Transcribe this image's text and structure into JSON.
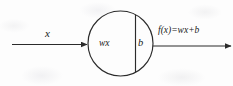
{
  "diagram": {
    "type": "neuron-schematic",
    "stroke_color": "#2b2b2b",
    "background_color": "#fdfdfd",
    "input_arrow": {
      "label": "x",
      "direction": "right",
      "name": "input-signal"
    },
    "node": {
      "shape": "circle",
      "left_region_label": "wx",
      "right_region_label": "b",
      "divider": "vertical-chord"
    },
    "output_arrow": {
      "label": "f(x)=wx+b",
      "direction": "right",
      "name": "output-signal"
    }
  }
}
